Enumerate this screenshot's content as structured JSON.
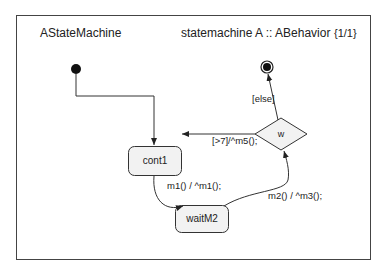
{
  "frame": {
    "name": "AStateMachine",
    "header": "statemachine A :: ABehavior",
    "page": "{1/1}"
  },
  "states": {
    "cont1": "cont1",
    "waitM2": "waitM2",
    "choice": "w"
  },
  "transitions": {
    "cont1_to_waitM2": "m1() / ^m1();",
    "waitM2_to_choice": "m2() / ^m3();",
    "choice_to_cont1": "[>7]/^m5();",
    "choice_to_final": "[else]"
  },
  "colors": {
    "state_fill": "#f2f2f2",
    "stroke": "#333333"
  }
}
